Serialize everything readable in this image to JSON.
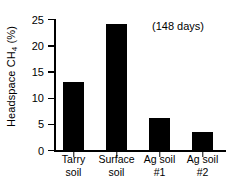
{
  "chart_data": {
    "type": "bar",
    "title": "",
    "xlabel": "",
    "ylabel": "Headspace CH4 (%)",
    "ylabel_text": "Headspace CH",
    "ylabel_sub": "4",
    "ylabel_unit": " (%)",
    "categories": [
      "Tarry soil",
      "Surface soil",
      "Ag soil #1",
      "Ag soil #2"
    ],
    "category_lines": [
      [
        "Tarry",
        "soil"
      ],
      [
        "Surface",
        "soil"
      ],
      [
        "Ag soil",
        "#1"
      ],
      [
        "Ag soil",
        "#2"
      ]
    ],
    "values": [
      13.0,
      24.0,
      6.2,
      3.4
    ],
    "ylim": [
      0,
      25
    ],
    "yticks": [
      0,
      5,
      10,
      15,
      20,
      25
    ],
    "ytick_labels": [
      "0",
      "5",
      "10",
      "15",
      "20",
      "25"
    ],
    "grid": false,
    "legend": false,
    "annotations": [
      {
        "text": "(148 days)",
        "x": 2.6,
        "y": 23
      }
    ],
    "bar_color": "#000000",
    "background_color": "#ffffff",
    "axis_color": "#000000"
  },
  "annotation": {
    "days_note": "(148 days)"
  }
}
